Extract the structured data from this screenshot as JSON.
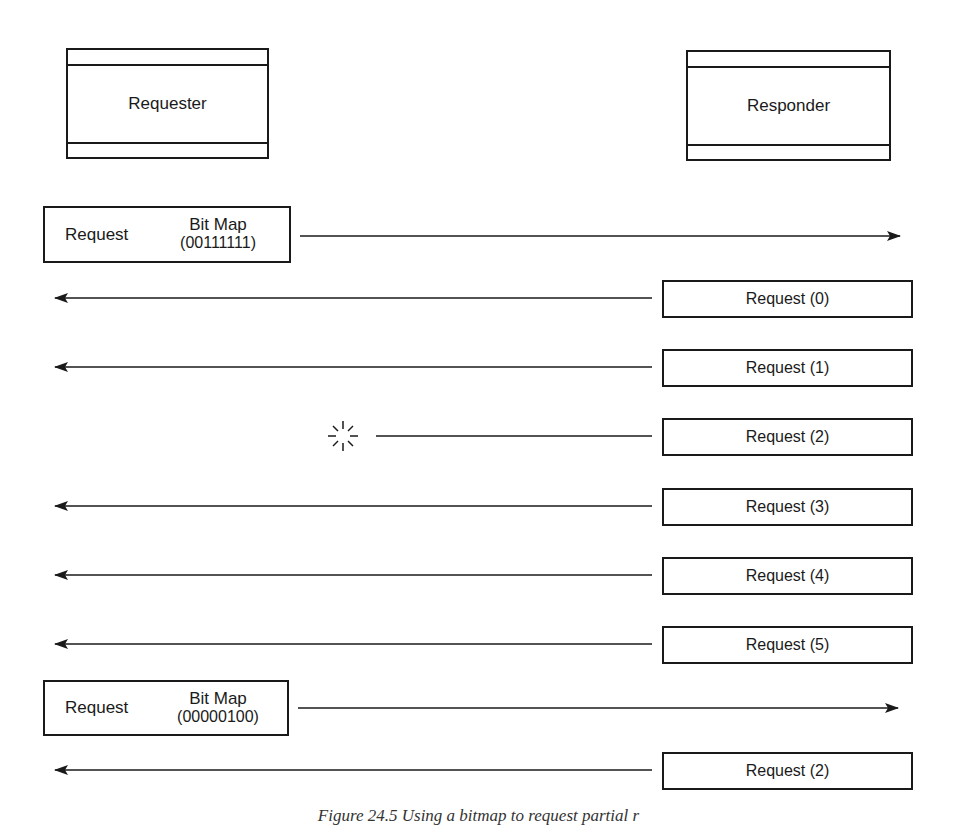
{
  "entities": {
    "requester": {
      "label": "Requester"
    },
    "responder": {
      "label": "Responder"
    }
  },
  "messages": [
    {
      "direction": "requester-to-responder",
      "label": "Request",
      "bitmap_label": "Bit Map",
      "bitmap_value": "(00111111)"
    },
    {
      "direction": "responder-to-requester",
      "label": "Request (0)",
      "delivered": true
    },
    {
      "direction": "responder-to-requester",
      "label": "Request (1)",
      "delivered": true
    },
    {
      "direction": "responder-to-requester",
      "label": "Request (2)",
      "delivered": false,
      "lost_marker": "lost-packet-burst"
    },
    {
      "direction": "responder-to-requester",
      "label": "Request (3)",
      "delivered": true
    },
    {
      "direction": "responder-to-requester",
      "label": "Request (4)",
      "delivered": true
    },
    {
      "direction": "responder-to-requester",
      "label": "Request (5)",
      "delivered": true
    },
    {
      "direction": "requester-to-responder",
      "label": "Request",
      "bitmap_label": "Bit Map",
      "bitmap_value": "(00000100)"
    },
    {
      "direction": "responder-to-requester",
      "label": "Request (2)",
      "delivered": true
    }
  ],
  "caption": "Figure 24.5   Using a bitmap to request partial r",
  "colors": {
    "ink": "#1a1a1a",
    "background": "#ffffff"
  }
}
